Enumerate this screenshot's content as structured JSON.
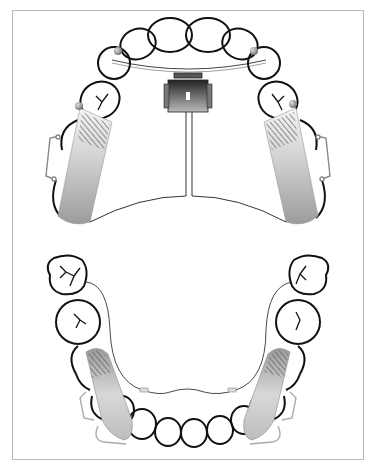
{
  "figure": {
    "upper_arch": {
      "appliance": "rapid palatal expander with central jackscrew and bilateral bonded acrylic splints",
      "components": [
        "expansion-screw",
        "midline-wire",
        "palatal-connector",
        "left-acrylic-splint",
        "right-acrylic-splint",
        "left-buccal-clasp",
        "right-buccal-clasp",
        "labial-bow-wire"
      ]
    },
    "lower_arch": {
      "appliance": "lingual arch with bilateral bonded splints",
      "components": [
        "lingual-arch-wire",
        "left-splint",
        "right-splint",
        "left-clasp",
        "right-clasp"
      ]
    },
    "colors": {
      "tooth_outline": "#111111",
      "frame_border": "#b8b8b8",
      "splint_gradient_dark": "#8a8a8a",
      "splint_gradient_light": "#f2f2f2",
      "ball_clasp": "#9a9a9a"
    }
  },
  "caption": {
    "text": ""
  }
}
